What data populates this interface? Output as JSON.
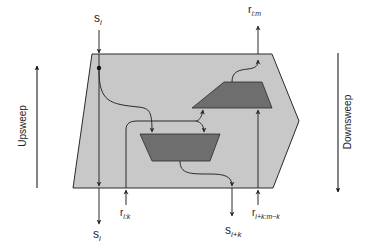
{
  "diagram": {
    "title": "",
    "labels": {
      "s_in_top": {
        "base": "s",
        "sub": "i"
      },
      "r_out_top": {
        "base": "r",
        "sub": "i:m"
      },
      "r_in_left": {
        "base": "r",
        "sub": "i:k"
      },
      "s_out_left": {
        "base": "s",
        "sub": "i"
      },
      "s_out_right": {
        "base": "s",
        "sub": "i+k"
      },
      "r_in_right": {
        "base": "r",
        "sub": "i+k:m−k"
      }
    },
    "side_labels": {
      "left": "Upsweep",
      "right": "Downsweep"
    },
    "colors": {
      "container_fill": "#c8c8c8",
      "operator_fill": "#6e6e6e",
      "stroke": "#2a2a2a"
    }
  }
}
